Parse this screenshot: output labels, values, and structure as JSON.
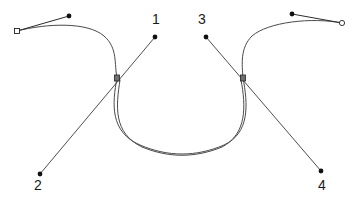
{
  "figure": {
    "width": 359,
    "height": 202,
    "background_color": "#ffffff",
    "curve_color": "#4a4a4a",
    "handle_color": "#2b2b2b",
    "node_fill_color": "#111111",
    "node_hollow_fill": "#ffffff",
    "node_square_fill": "#6f6f6f"
  },
  "labels": [
    {
      "id": "label-1",
      "text": "1",
      "x": 152,
      "y": 12
    },
    {
      "id": "label-2",
      "text": "2",
      "x": 34,
      "y": 178
    },
    {
      "id": "label-3",
      "text": "3",
      "x": 198,
      "y": 12
    },
    {
      "id": "label-4",
      "text": "4",
      "x": 318,
      "y": 178
    }
  ],
  "chart_data": {
    "type": "line",
    "xlabel": "",
    "ylabel": "",
    "xlim": [
      0,
      359
    ],
    "ylim": [
      0,
      202
    ],
    "grid": false,
    "legend": "none",
    "annotations": [
      "1",
      "2",
      "3",
      "4"
    ],
    "series": [
      {
        "name": "left-outer-curve",
        "kind": "spline",
        "path": "M 17,31 C 48,23 88,22 104,36 C 118,48 114,64 117,78",
        "points": [
          [
            17,
            31
          ],
          [
            104,
            36
          ],
          [
            117,
            78
          ]
        ]
      },
      {
        "name": "right-outer-curve",
        "kind": "spline",
        "path": "M 342,23 C 312,17 268,22 252,36 C 240,48 242,64 243,78",
        "points": [
          [
            342,
            23
          ],
          [
            252,
            36
          ],
          [
            243,
            78
          ]
        ]
      },
      {
        "name": "central-bowl-curve",
        "kind": "spline",
        "path": "M 117,78 C 112,104 110,132 140,145 C 168,157 196,157 224,145 C 250,133 248,104 243,78",
        "points": [
          [
            117,
            78
          ],
          [
            180,
            150
          ],
          [
            243,
            78
          ]
        ]
      },
      {
        "name": "inner-bowl-shadow-curve",
        "kind": "spline",
        "path": "M 120,80 C 116,106 113,133 142,147 C 169,158 195,158 222,147 C 247,134 246,106 241,80",
        "points": [
          [
            120,
            80
          ],
          [
            180,
            152
          ],
          [
            241,
            80
          ]
        ]
      },
      {
        "name": "handle-line-1-to-2",
        "kind": "segment",
        "path": "M 155,37 L 40,174",
        "points": [
          [
            155,
            37
          ],
          [
            117,
            78
          ],
          [
            40,
            174
          ]
        ]
      },
      {
        "name": "handle-line-3-to-4",
        "kind": "segment",
        "path": "M 206,37 L 321,171",
        "points": [
          [
            206,
            37
          ],
          [
            243,
            78
          ],
          [
            321,
            171
          ]
        ]
      },
      {
        "name": "left-tangent-handle",
        "kind": "segment",
        "path": "M 17,31 L 69,16",
        "points": [
          [
            17,
            31
          ],
          [
            69,
            16
          ]
        ]
      },
      {
        "name": "right-tangent-handle",
        "kind": "segment",
        "path": "M 342,23 L 292,14",
        "points": [
          [
            342,
            23
          ],
          [
            292,
            14
          ]
        ]
      }
    ],
    "markers": [
      {
        "name": "left-endpoint-hollow",
        "shape": "hollow-square",
        "x": 17,
        "y": 31
      },
      {
        "name": "left-handle-dot",
        "shape": "filled-dot",
        "x": 69,
        "y": 16
      },
      {
        "name": "left-junction-square",
        "shape": "filled-square",
        "x": 117,
        "y": 78
      },
      {
        "name": "point-1-dot",
        "shape": "filled-dot",
        "x": 155,
        "y": 37
      },
      {
        "name": "point-2-dot",
        "shape": "filled-dot",
        "x": 40,
        "y": 174
      },
      {
        "name": "point-3-dot",
        "shape": "filled-dot",
        "x": 206,
        "y": 37
      },
      {
        "name": "point-4-dot",
        "shape": "filled-dot",
        "x": 321,
        "y": 171
      },
      {
        "name": "right-junction-square",
        "shape": "filled-square",
        "x": 243,
        "y": 78
      },
      {
        "name": "right-handle-dot",
        "shape": "filled-dot",
        "x": 292,
        "y": 14
      },
      {
        "name": "right-endpoint-hollow",
        "shape": "hollow-circle",
        "x": 342,
        "y": 23
      }
    ]
  }
}
